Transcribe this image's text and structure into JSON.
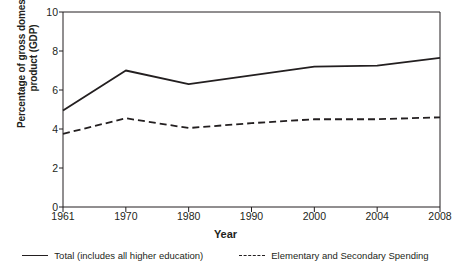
{
  "chart_data": {
    "type": "line",
    "title": "",
    "xlabel": "Year",
    "ylabel": "Percentage of gross domestic\nproduct (GDP)",
    "categories": [
      "1961",
      "1970",
      "1980",
      "1990",
      "2000",
      "2004",
      "2008"
    ],
    "xtick_labels": [
      "1961",
      "1970",
      "1980",
      "1990",
      "2000",
      "2004",
      "2008"
    ],
    "ytick_labels": [
      "0",
      "2",
      "4",
      "6",
      "8",
      "10"
    ],
    "yticks": [
      0,
      2,
      4,
      6,
      8,
      10
    ],
    "ylim": [
      0,
      10
    ],
    "grid": false,
    "legend_position": "bottom",
    "series": [
      {
        "name": "Total (includes all higher education)",
        "style": "solid",
        "color": "#231f20",
        "values": [
          4.95,
          7.0,
          6.3,
          6.75,
          7.2,
          7.25,
          7.65
        ]
      },
      {
        "name": "Elementary and Secondary Spending",
        "style": "dashed",
        "color": "#231f20",
        "values": [
          3.75,
          4.55,
          4.05,
          4.3,
          4.5,
          4.5,
          4.6
        ]
      }
    ]
  },
  "legend": {
    "items": [
      {
        "label": "Total (includes all higher education)",
        "style": "solid"
      },
      {
        "label": "Elementary and Secondary Spending",
        "style": "dashed"
      }
    ]
  },
  "axis": {
    "x_title": "Year",
    "y_title": "Percentage of gross domestic\nproduct (GDP)"
  },
  "colors": {
    "line": "#231f20",
    "axis": "#231f20",
    "background": "#ffffff"
  }
}
